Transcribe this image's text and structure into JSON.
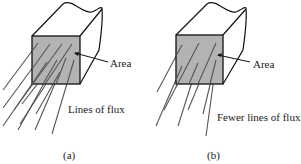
{
  "figure": {
    "panels": [
      {
        "id": "a",
        "caption": "(a)",
        "area_label": "Area",
        "flux_label": "Lines of flux"
      },
      {
        "id": "b",
        "caption": "(b)",
        "area_label": "Area",
        "flux_label": "Fewer lines of flux"
      }
    ],
    "colors": {
      "face_fill": "#b3b3b3",
      "stroke": "#111111",
      "flux_line": "#555555"
    }
  }
}
